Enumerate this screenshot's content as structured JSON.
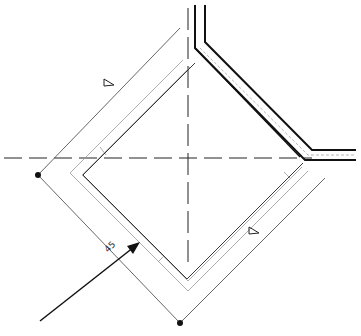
{
  "drawing": {
    "type": "technical-plan",
    "background": "#ffffff",
    "line_color": "#111111",
    "thin_line_color": "#555555",
    "faint_line_color": "#aaaaaa",
    "dimension_label": "45",
    "markers": {
      "triangle_top": "section-marker-triangle",
      "triangle_bottom": "section-marker-triangle",
      "node_left": "node-dot",
      "node_bottom": "node-dot"
    },
    "arrow": "direction-arrow"
  }
}
